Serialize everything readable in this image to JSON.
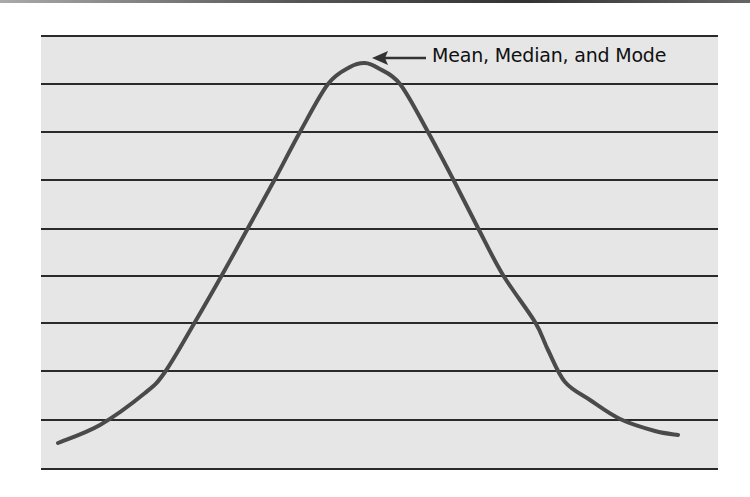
{
  "chart_data": {
    "type": "line",
    "title": "",
    "xlabel": "",
    "ylabel": "",
    "annotations": [
      {
        "text": "Mean, Median, and Mode",
        "points_to": "peak",
        "arrow": true
      }
    ],
    "grid": {
      "horizontal_lines": 10,
      "vertical_lines": 0
    },
    "legend": null,
    "axis_ticks": {
      "x": [],
      "y": []
    },
    "series": [
      {
        "name": "distribution",
        "points": [
          [
            58,
            443
          ],
          [
            100,
            425
          ],
          [
            145,
            393
          ],
          [
            165,
            372
          ],
          [
            195,
            322
          ],
          [
            222,
            275
          ],
          [
            248,
            228
          ],
          [
            275,
            179
          ],
          [
            300,
            132
          ],
          [
            328,
            84
          ],
          [
            350,
            67
          ],
          [
            365,
            63
          ],
          [
            378,
            68
          ],
          [
            400,
            84
          ],
          [
            428,
            132
          ],
          [
            453,
            179
          ],
          [
            478,
            228
          ],
          [
            503,
            275
          ],
          [
            535,
            322
          ],
          [
            548,
            350
          ],
          [
            565,
            382
          ],
          [
            590,
            400
          ],
          [
            620,
            419
          ],
          [
            655,
            431
          ],
          [
            678,
            435
          ]
        ]
      }
    ]
  },
  "annotation": {
    "label": "Mean, Median, and Mode"
  },
  "colors": {
    "plot_background": "#e6e6e6",
    "grid_line": "#2a2a2a",
    "curve": "#4a4a4a",
    "text": "#111111"
  },
  "layout": {
    "plot_left": 41,
    "plot_right": 718,
    "grid_y": [
      36,
      84,
      132,
      180,
      229,
      276,
      323,
      371,
      420,
      469
    ]
  }
}
